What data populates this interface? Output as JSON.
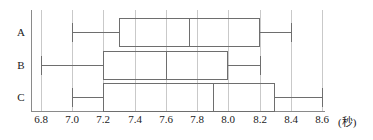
{
  "chart_data": {
    "type": "box",
    "title": "",
    "xlabel": "",
    "ylabel": "",
    "unit": "(秒)",
    "xlim": [
      6.8,
      8.6
    ],
    "grid": true,
    "legend": false,
    "orientation": "horizontal",
    "categories": [
      "A",
      "B",
      "C"
    ],
    "xticks": [
      {
        "value": 6.8,
        "label": "6.8"
      },
      {
        "value": 7.0,
        "label": "7.0"
      },
      {
        "value": 7.2,
        "label": "7.2"
      },
      {
        "value": 7.4,
        "label": "7.4"
      },
      {
        "value": 7.6,
        "label": "7.6"
      },
      {
        "value": 7.8,
        "label": "7.8"
      },
      {
        "value": 8.0,
        "label": "8.0"
      },
      {
        "value": 8.2,
        "label": "8.2"
      },
      {
        "value": 8.4,
        "label": "8.4"
      },
      {
        "value": 8.6,
        "label": "8.6"
      }
    ],
    "boxes": [
      {
        "category": "A",
        "min": 7.0,
        "q1": 7.3,
        "median": 7.75,
        "q3": 8.2,
        "max": 8.4
      },
      {
        "category": "B",
        "min": 6.8,
        "q1": 7.2,
        "median": 7.6,
        "q3": 8.0,
        "max": 8.2
      },
      {
        "category": "C",
        "min": 7.0,
        "q1": 7.2,
        "median": 7.9,
        "q3": 8.3,
        "max": 8.6
      }
    ]
  },
  "style": {
    "box_stroke": "#6e6e6e",
    "grid_color": "#c9c9c9",
    "axis_color": "#8a8a8a",
    "text_color": "#1a1a1a",
    "background": "#ffffff"
  }
}
